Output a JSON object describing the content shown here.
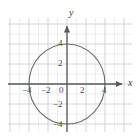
{
  "figure": {
    "width": 140,
    "height": 140,
    "background": "#ffffff"
  },
  "chart_data": {
    "type": "line",
    "title": "",
    "subtitle": "",
    "xlabel": "x",
    "ylabel": "y",
    "xlim": [
      -6.2,
      7.0
    ],
    "ylim": [
      -6.6,
      6.6
    ],
    "xticks": [
      -4,
      -2,
      0,
      2,
      4
    ],
    "xtick_labels": [
      "−4",
      "−2",
      "0",
      "2",
      "4"
    ],
    "yticks": [
      4,
      2,
      -2,
      -4
    ],
    "ytick_labels": [
      "4",
      "2",
      "−2",
      "−4"
    ],
    "grid": true,
    "grid_minor_spacing": 1,
    "grid_major_spacing": 2,
    "legend": "none",
    "annotations": [],
    "series": [
      {
        "name": "ellipse",
        "shape": "ellipse",
        "center": [
          0,
          0
        ],
        "semi_axis_x": 4,
        "semi_axis_y": 4,
        "equation": "x^2 + y^2 = 16",
        "x_intercepts": [
          -4,
          4
        ],
        "y_intercepts": [
          -4,
          4
        ],
        "color": "#6b6b6b",
        "linewidth": 1.1,
        "closed": true
      }
    ]
  },
  "axes": {
    "x_label": "x",
    "y_label": "y",
    "axis_color": "#5a5a5a",
    "arrowheads": [
      "x-positive",
      "y-positive"
    ],
    "origin_label": "0"
  },
  "ticks": {
    "x": [
      {
        "value": -4,
        "label": "−4"
      },
      {
        "value": -2,
        "label": "−2"
      },
      {
        "value": 0,
        "label": "0"
      },
      {
        "value": 2,
        "label": "2"
      },
      {
        "value": 4,
        "label": "4"
      }
    ],
    "y": [
      {
        "value": 4,
        "label": "4"
      },
      {
        "value": 2,
        "label": "2"
      },
      {
        "value": -2,
        "label": "−2"
      },
      {
        "value": -4,
        "label": "−4"
      }
    ]
  },
  "colors": {
    "grid_minor": "#e2e2e2",
    "grid_major": "#cfcfcf",
    "axis": "#5a5a5a",
    "curve": "#6b6b6b",
    "text": "#4a4a4a",
    "background": "#ffffff"
  }
}
